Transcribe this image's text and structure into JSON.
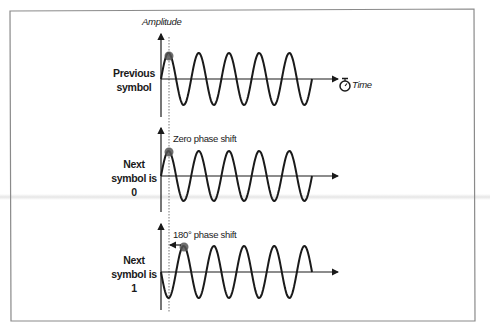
{
  "figure": {
    "y_axis_label": "Amplitude",
    "x_axis_label": "Time",
    "x_axis_icon": "stopwatch-icon",
    "colors": {
      "line": "#1a1a1a",
      "frame": "#8a8a8a",
      "marker": "#555555",
      "dotted": "#777777"
    }
  },
  "panels": [
    {
      "id": "previous",
      "label_lines": [
        "Previous",
        "symbol"
      ],
      "annotation": "",
      "phase_deg": 0,
      "cycles": 5
    },
    {
      "id": "next0",
      "label_lines": [
        "Next",
        "symbol is",
        "0"
      ],
      "annotation": "Zero phase shift",
      "phase_deg": 0,
      "cycles": 5
    },
    {
      "id": "next1",
      "label_lines": [
        "Next",
        "symbol is",
        "1"
      ],
      "annotation": "180° phase shift",
      "phase_deg": 180,
      "cycles": 5
    }
  ]
}
